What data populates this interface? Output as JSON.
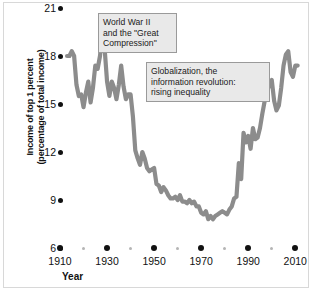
{
  "chart_data": {
    "type": "line",
    "title": "",
    "xlabel": "Year",
    "ylabel_line1": "Income of top 1 percent",
    "ylabel_line2": "(percentage of total income)",
    "xlim": [
      1910,
      2012
    ],
    "ylim": [
      6,
      21
    ],
    "grid": false,
    "legend": null,
    "y_ticks": [
      6,
      9,
      12,
      15,
      18,
      21
    ],
    "y_tick_labels": [
      "6",
      "9",
      "12",
      "15",
      "18",
      "21"
    ],
    "x_ticks_major": [
      1910,
      1930,
      1950,
      1970,
      1990,
      2010
    ],
    "x_tick_labels": [
      "1910",
      "1930",
      "1950",
      "1970",
      "1990",
      "2010"
    ],
    "x_ticks_minor": [
      1920,
      1940,
      1960,
      1980,
      2000
    ],
    "series": [
      {
        "name": "Income share of top 1 percent",
        "color": "#8c8c8c",
        "x": [
          1913,
          1914,
          1915,
          1916,
          1917,
          1918,
          1919,
          1920,
          1921,
          1922,
          1923,
          1924,
          1925,
          1926,
          1927,
          1928,
          1929,
          1930,
          1931,
          1932,
          1933,
          1934,
          1935,
          1936,
          1937,
          1938,
          1939,
          1940,
          1941,
          1942,
          1943,
          1944,
          1945,
          1946,
          1947,
          1948,
          1949,
          1950,
          1951,
          1952,
          1953,
          1954,
          1955,
          1956,
          1957,
          1958,
          1959,
          1960,
          1961,
          1962,
          1963,
          1964,
          1965,
          1966,
          1967,
          1968,
          1969,
          1970,
          1971,
          1972,
          1973,
          1974,
          1975,
          1976,
          1977,
          1978,
          1979,
          1980,
          1981,
          1982,
          1983,
          1984,
          1985,
          1986,
          1987,
          1988,
          1989,
          1990,
          1991,
          1992,
          1993,
          1994,
          1995,
          1996,
          1997,
          1998,
          1999,
          2000,
          2001,
          2002,
          2003,
          2004,
          2005,
          2006,
          2007,
          2008,
          2009,
          2010,
          2011
        ],
        "y": [
          18.0,
          18.0,
          18.3,
          18.0,
          16.2,
          15.5,
          15.6,
          14.8,
          15.7,
          16.4,
          15.1,
          16.0,
          17.4,
          17.2,
          18.0,
          19.4,
          18.4,
          16.4,
          15.5,
          16.4,
          16.0,
          15.3,
          16.2,
          17.4,
          16.1,
          15.3,
          15.6,
          15.6,
          14.2,
          12.1,
          11.6,
          11.2,
          12.0,
          11.6,
          11.0,
          10.8,
          10.9,
          11.0,
          10.0,
          9.9,
          9.5,
          9.8,
          9.6,
          9.3,
          9.1,
          9.1,
          9.2,
          9.0,
          9.3,
          8.9,
          8.9,
          8.8,
          9.0,
          8.8,
          8.9,
          8.6,
          8.6,
          8.2,
          8.1,
          8.3,
          7.8,
          8.0,
          7.8,
          8.0,
          8.1,
          8.2,
          8.3,
          8.2,
          8.1,
          8.4,
          8.6,
          9.1,
          9.2,
          11.3,
          10.3,
          13.2,
          12.6,
          13.0,
          12.2,
          13.5,
          12.8,
          12.9,
          13.5,
          14.4,
          15.2,
          15.7,
          16.3,
          16.5,
          15.2,
          14.6,
          14.9,
          16.0,
          17.4,
          18.1,
          18.3,
          17.0,
          16.7,
          17.4,
          17.4
        ]
      }
    ],
    "annotations": [
      {
        "id": "wwii",
        "lines": [
          "World War II",
          "and the \"Great",
          "Compression\""
        ]
      },
      {
        "id": "globalization",
        "lines": [
          "Globalization, the",
          "information revolution:",
          "rising inequality"
        ]
      }
    ]
  },
  "colors": {
    "line": "#8c8c8c",
    "text": "#111111",
    "callout_bg": "#e9e9e9",
    "callout_border": "#9a9a9a",
    "frame_border": "#d8d8d8",
    "minor_tick": "#b5b5b5",
    "background": "#ffffff"
  }
}
